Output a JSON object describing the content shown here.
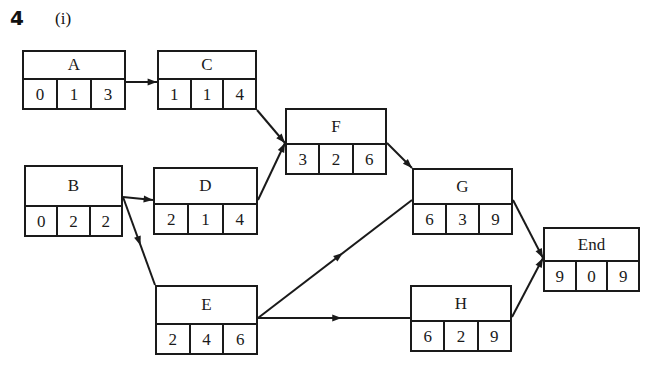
{
  "header": {
    "question_number": "4",
    "part_label": "(i)"
  },
  "diagram": {
    "type": "activity-on-node-network",
    "cell_count_per_node": 3,
    "nodes": [
      {
        "id": "A",
        "label": "A",
        "cells": [
          "0",
          "1",
          "3"
        ],
        "x": 22,
        "y": 50,
        "w": 104,
        "h": 60
      },
      {
        "id": "C",
        "label": "C",
        "cells": [
          "1",
          "1",
          "4"
        ],
        "x": 157,
        "y": 50,
        "w": 100,
        "h": 60
      },
      {
        "id": "F",
        "label": "F",
        "cells": [
          "3",
          "2",
          "6"
        ],
        "x": 285,
        "y": 108,
        "w": 102,
        "h": 67
      },
      {
        "id": "B",
        "label": "B",
        "cells": [
          "0",
          "2",
          "2"
        ],
        "x": 24,
        "y": 165,
        "w": 99,
        "h": 72
      },
      {
        "id": "D",
        "label": "D",
        "cells": [
          "2",
          "1",
          "4"
        ],
        "x": 153,
        "y": 167,
        "w": 105,
        "h": 68
      },
      {
        "id": "G",
        "label": "G",
        "cells": [
          "6",
          "3",
          "9"
        ],
        "x": 412,
        "y": 168,
        "w": 101,
        "h": 67
      },
      {
        "id": "End",
        "label": "End",
        "cells": [
          "9",
          "0",
          "9"
        ],
        "x": 543,
        "y": 227,
        "w": 97,
        "h": 65
      },
      {
        "id": "E",
        "label": "E",
        "cells": [
          "2",
          "4",
          "6"
        ],
        "x": 155,
        "y": 285,
        "w": 103,
        "h": 70
      },
      {
        "id": "H",
        "label": "H",
        "cells": [
          "6",
          "2",
          "9"
        ],
        "x": 410,
        "y": 285,
        "w": 102,
        "h": 67
      }
    ],
    "edges": [
      {
        "from": "A",
        "to": "C",
        "x1": 126,
        "y1": 82,
        "x2": 157,
        "y2": 82
      },
      {
        "from": "C",
        "to": "F",
        "x1": 257,
        "y1": 110,
        "x2": 285,
        "y2": 143
      },
      {
        "from": "B",
        "to": "D",
        "x1": 123,
        "y1": 197,
        "x2": 153,
        "y2": 200
      },
      {
        "from": "D",
        "to": "F",
        "x1": 258,
        "y1": 200,
        "x2": 285,
        "y2": 143
      },
      {
        "from": "B",
        "to": "E",
        "x1": 123,
        "y1": 197,
        "x2": 155,
        "y2": 285
      },
      {
        "from": "F",
        "to": "G",
        "x1": 387,
        "y1": 143,
        "x2": 412,
        "y2": 168
      },
      {
        "from": "E",
        "to": "G",
        "x1": 258,
        "y1": 318,
        "x2": 412,
        "y2": 200
      },
      {
        "from": "E",
        "to": "H",
        "x1": 258,
        "y1": 318,
        "x2": 410,
        "y2": 318
      },
      {
        "from": "G",
        "to": "End",
        "x1": 513,
        "y1": 200,
        "x2": 543,
        "y2": 258
      },
      {
        "from": "H",
        "to": "End",
        "x1": 512,
        "y1": 317,
        "x2": 543,
        "y2": 258
      }
    ],
    "colors": {
      "stroke": "#1a1a1a",
      "background": "#ffffff"
    }
  }
}
